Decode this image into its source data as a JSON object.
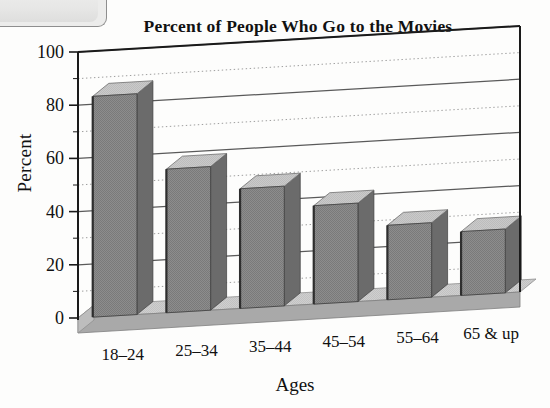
{
  "chart_data": {
    "type": "bar",
    "title": "Percent of People Who Go to the Movies",
    "xlabel": "Ages",
    "ylabel": "Percent",
    "categories": [
      "18–24",
      "25–34",
      "35–44",
      "45–54",
      "55–64",
      "65 & up"
    ],
    "values": [
      83,
      54,
      45,
      37,
      28,
      24
    ],
    "ylim": [
      0,
      100
    ],
    "yticks": [
      0,
      20,
      40,
      60,
      80,
      100
    ],
    "ytick_labels": [
      "0",
      "20",
      "40",
      "60",
      "80",
      "100"
    ],
    "minor_gridline_step": 10,
    "grid": true,
    "legend": null,
    "style": "3d-bar",
    "colors": {
      "bar_front": "#8a8a8a",
      "bar_top": "#c6c6c6",
      "bar_side": "#6b6b6b",
      "floor": "#c9c9c9",
      "floor_side": "#a9a9a9",
      "axis": "#1a1a1a",
      "gridline_major": "#5a5a5a",
      "gridline_minor": "#9e9e9e",
      "background": "#fdfdfc"
    }
  },
  "page": {
    "title": "Percent of People Who Go to the Movies",
    "y_axis_title": "Percent",
    "x_axis_title": "Ages"
  }
}
